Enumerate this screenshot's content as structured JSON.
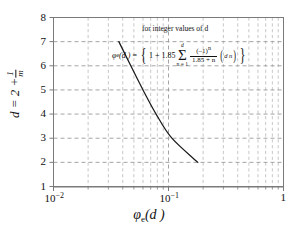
{
  "chart_data": {
    "type": "line",
    "title": "",
    "xlabel": "φₑ(d)",
    "ylabel": "d = 2 + 1/m",
    "xscale": "log",
    "yscale": "linear",
    "xlim": [
      0.01,
      1
    ],
    "ylim": [
      1,
      8
    ],
    "grid": true,
    "legend": null,
    "x_tick_labels": [
      "10-2",
      "10-1",
      "1"
    ],
    "x_tick_values": [
      0.01,
      0.1,
      1
    ],
    "y_tick_labels": [
      "1",
      "2",
      "3",
      "4",
      "5",
      "6",
      "7",
      "8"
    ],
    "y_tick_values": [
      1,
      2,
      3,
      4,
      5,
      6,
      7,
      8
    ],
    "series": [
      {
        "name": "phi_e(d)",
        "x": [
          0.037,
          0.047,
          0.06,
          0.078,
          0.107,
          0.18
        ],
        "y": [
          7,
          6,
          5,
          4,
          3,
          2
        ],
        "color": "#1a1a1a"
      }
    ],
    "annotations": {
      "note": "for integer values of d",
      "formula_parts": {
        "lhs": "φ",
        "lhs_sub": "e",
        "lhs_arg": "(d )",
        "equals": "=",
        "open_brace": "{",
        "one_plus": "1 + 1.85",
        "sigma": "Σ",
        "sigma_upper": "d",
        "sigma_lower": "n = 1",
        "frac_num": "(–1)",
        "frac_num_sup": "n",
        "frac_den": "1.85 + n",
        "binom_top": "d",
        "binom_bottom": "n",
        "close_brace": "}"
      }
    }
  },
  "axes": {
    "y_label_prefix": "d = 2 +",
    "y_label_frac_num": "1",
    "y_label_frac_den": "m",
    "x_label_base": "φ",
    "x_label_sub": "e",
    "x_label_arg": "(d )"
  },
  "colors": {
    "curve": "#1a1a1a",
    "grid_major": "#9a9a9a",
    "grid_minor": "#b4b4b4",
    "frame": "#7a7a7a",
    "text": "#111111",
    "background": "#ffffff"
  }
}
